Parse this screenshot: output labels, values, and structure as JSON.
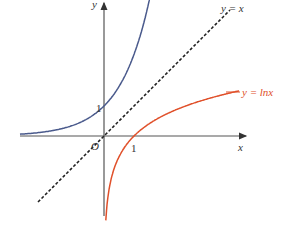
{
  "chart_data": {
    "type": "line",
    "title": "",
    "xlabel": "x",
    "ylabel": "y",
    "origin_label": "O",
    "xlim": [
      -2.8,
      4.7
    ],
    "ylim": [
      -2.7,
      4.4
    ],
    "ticks": {
      "x": [
        {
          "value": 1,
          "label": "1"
        }
      ],
      "y": [
        {
          "value": 1,
          "label": "1"
        }
      ]
    },
    "series": [
      {
        "name": "y = e^x",
        "function": "exp",
        "color": "#4a5a8c",
        "style": "solid",
        "label": ""
      },
      {
        "name": "y = x",
        "function": "identity",
        "color": "#222222",
        "style": "dashed",
        "label": "y = x"
      },
      {
        "name": "y = ln x",
        "function": "ln",
        "color": "#e0502a",
        "style": "solid",
        "label": "y = lnx"
      }
    ]
  }
}
